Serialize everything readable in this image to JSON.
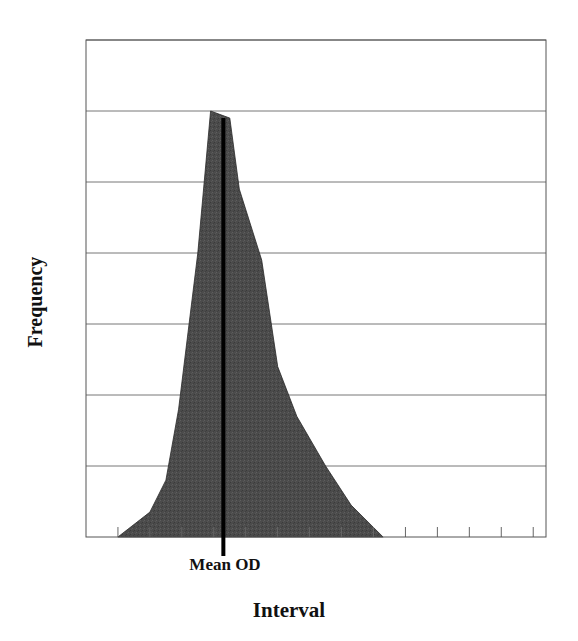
{
  "chart_data": {
    "type": "area",
    "title": "",
    "xlabel": "Interval",
    "ylabel": "Frequency",
    "annotation": {
      "label": "Mean OD",
      "x": 3.3,
      "style": "vertical-line"
    },
    "x": [
      0,
      1,
      1.5,
      1.9,
      2.2,
      2.5,
      2.9,
      3.5,
      3.8,
      4.5,
      5.0,
      5.6,
      6.5,
      7.3,
      8.3
    ],
    "values": [
      0,
      0.35,
      0.8,
      1.8,
      2.9,
      4.0,
      6.0,
      5.9,
      4.9,
      3.9,
      2.4,
      1.7,
      1.0,
      0.45,
      0
    ],
    "ylim": [
      0,
      7
    ],
    "xlim": [
      -1,
      13.4
    ],
    "grid": {
      "horizontal": true,
      "vertical": false,
      "gridline_count": 7
    },
    "x_tick_count": 14,
    "fill_color": "#4a4a4a",
    "legend": null
  },
  "labels": {
    "y_axis": "Frequency",
    "x_axis": "Interval",
    "mean_marker": "Mean OD"
  }
}
